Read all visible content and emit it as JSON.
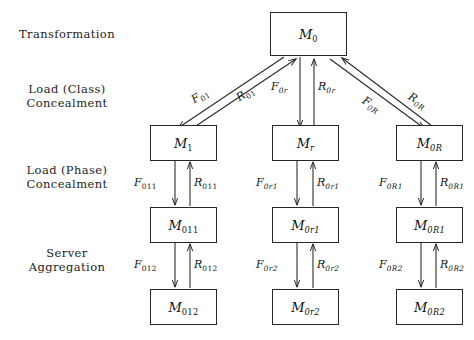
{
  "diagram": {
    "type": "hierarchical-block-diagram",
    "row_labels": [
      {
        "id": "transformation",
        "text": "Transformation"
      },
      {
        "id": "load-class-concealment",
        "text": "Load (Class)\nConcealment"
      },
      {
        "id": "load-phase-concealment",
        "text": "Load (Phase)\nConcealment"
      },
      {
        "id": "server-aggregation",
        "text": "Server\nAggregation"
      }
    ],
    "nodes": [
      {
        "id": "m0",
        "base": "M",
        "sub": "0",
        "sub_italic": false
      },
      {
        "id": "m1",
        "base": "M",
        "sub": "1",
        "sub_italic": false
      },
      {
        "id": "mr",
        "base": "M",
        "sub": "r",
        "sub_italic": true
      },
      {
        "id": "m0R",
        "base": "M",
        "sub": "0R",
        "sub_italic": true
      },
      {
        "id": "m011",
        "base": "M",
        "sub": "011",
        "sub_italic": false
      },
      {
        "id": "m0r1",
        "base": "M",
        "sub": "0r1",
        "sub_italic": true
      },
      {
        "id": "m0R1",
        "base": "M",
        "sub": "0R1",
        "sub_italic": true
      },
      {
        "id": "m012",
        "base": "M",
        "sub": "012",
        "sub_italic": false
      },
      {
        "id": "m0r2",
        "base": "M",
        "sub": "0r2",
        "sub_italic": true
      },
      {
        "id": "m0R2",
        "base": "M",
        "sub": "0R2",
        "sub_italic": true
      }
    ],
    "edge_labels": [
      {
        "id": "f01",
        "base": "F",
        "sub": "01",
        "sub_italic": false
      },
      {
        "id": "r01",
        "base": "R",
        "sub": "01",
        "sub_italic": false
      },
      {
        "id": "f0r",
        "base": "F",
        "sub": "0r",
        "sub_italic": true
      },
      {
        "id": "r0r",
        "base": "R",
        "sub": "0r",
        "sub_italic": true
      },
      {
        "id": "f0R",
        "base": "F",
        "sub": "0R",
        "sub_italic": true
      },
      {
        "id": "r0R",
        "base": "R",
        "sub": "0R",
        "sub_italic": true
      },
      {
        "id": "f011",
        "base": "F",
        "sub": "011",
        "sub_italic": false
      },
      {
        "id": "r011",
        "base": "R",
        "sub": "011",
        "sub_italic": false
      },
      {
        "id": "f0r1",
        "base": "F",
        "sub": "0r1",
        "sub_italic": true
      },
      {
        "id": "r0r1",
        "base": "R",
        "sub": "0r1",
        "sub_italic": true
      },
      {
        "id": "f0R1",
        "base": "F",
        "sub": "0R1",
        "sub_italic": true
      },
      {
        "id": "r0R1",
        "base": "R",
        "sub": "0R1",
        "sub_italic": true
      },
      {
        "id": "f012",
        "base": "F",
        "sub": "012",
        "sub_italic": false
      },
      {
        "id": "r012",
        "base": "R",
        "sub": "012",
        "sub_italic": false
      },
      {
        "id": "f0r2",
        "base": "F",
        "sub": "0r2",
        "sub_italic": true
      },
      {
        "id": "r0r2",
        "base": "R",
        "sub": "0r2",
        "sub_italic": true
      },
      {
        "id": "f0R2",
        "base": "F",
        "sub": "0R2",
        "sub_italic": true
      },
      {
        "id": "r0R2",
        "base": "R",
        "sub": "0R2",
        "sub_italic": true
      }
    ],
    "colors": {
      "line": "#262626",
      "text": "#141414",
      "background": "#ffffff"
    }
  }
}
